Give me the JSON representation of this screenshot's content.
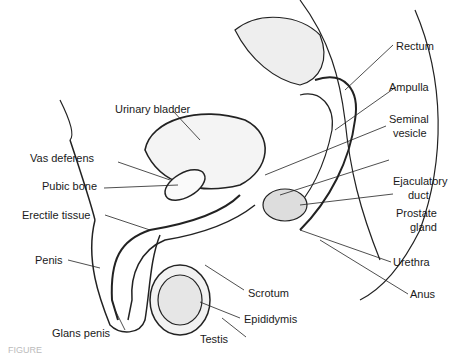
{
  "diagram": {
    "type": "anatomical sagittal section",
    "labels": {
      "urinary_bladder": "Urinary bladder",
      "vas_deferens": "Vas deferens",
      "pubic_bone": "Pubic bone",
      "erectile_tissue": "Erectile tissue",
      "penis": "Penis",
      "glans_penis": "Glans penis",
      "testis": "Testis",
      "epididymis": "Epididymis",
      "scrotum": "Scrotum",
      "anus": "Anus",
      "urethra": "Urethra",
      "prostate_gland_1": "Prostate",
      "prostate_gland_2": "gland",
      "ejaculatory_duct_1": "Ejaculatory",
      "ejaculatory_duct_2": "duct",
      "seminal_vesicle_1": "Seminal",
      "seminal_vesicle_2": "vesicle",
      "ampulla": "Ampulla",
      "rectum": "Rectum"
    },
    "caption_fragment": "FIGURE"
  }
}
